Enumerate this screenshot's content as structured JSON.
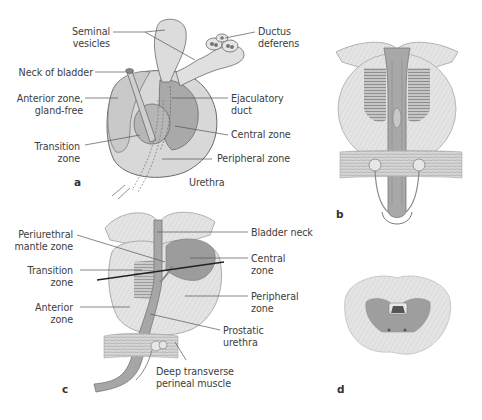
{
  "figure": {
    "panels": {
      "a": {
        "letter": "a",
        "labels": {
          "seminal_vesicles": [
            "Seminal",
            "vesicles"
          ],
          "ductus_deferens": [
            "Ductus",
            "deferens"
          ],
          "neck_of_bladder": "Neck of bladder",
          "anterior_zone": [
            "Anterior zone,",
            "gland-free"
          ],
          "ejaculatory_duct": [
            "Ejaculatory",
            "duct"
          ],
          "central_zone": "Central zone",
          "transition_zone": [
            "Transition",
            "zone"
          ],
          "peripheral_zone": "Peripheral zone",
          "urethra": "Urethra"
        }
      },
      "b": {
        "letter": "b"
      },
      "c": {
        "letter": "c",
        "labels": {
          "periurethral_mantle_zone": [
            "Periurethral",
            "mantle zone"
          ],
          "bladder_neck": "Bladder neck",
          "transition_zone": [
            "Transition",
            "zone"
          ],
          "central_zone": [
            "Central",
            "zone"
          ],
          "peripheral_zone": [
            "Peripheral",
            "zone"
          ],
          "anterior_zone": [
            "Anterior",
            "zone"
          ],
          "prostatic_urethra": [
            "Prostatic",
            "urethra"
          ],
          "deep_transverse_perineal_muscle": [
            "Deep transverse",
            "perineal muscle"
          ]
        }
      },
      "d": {
        "letter": "d"
      }
    },
    "colors": {
      "outline": "#6a6a6a",
      "light_gland": "#d9d9d9",
      "mid_gland": "#bdbdbd",
      "dark_zone": "#9a9a9a",
      "leader": "#555555"
    }
  }
}
